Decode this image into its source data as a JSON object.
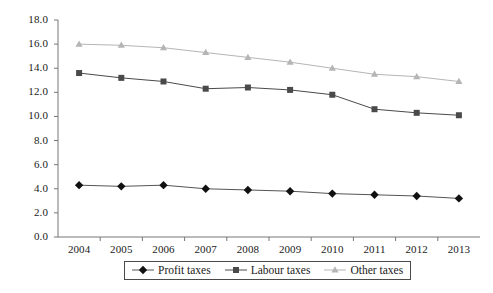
{
  "chart_data": {
    "type": "line",
    "title": "",
    "subtitle": "",
    "xlabel": "",
    "ylabel": "",
    "categories": [
      "2004",
      "2005",
      "2006",
      "2007",
      "2008",
      "2009",
      "2010",
      "2011",
      "2012",
      "2013"
    ],
    "ylim": [
      0.0,
      18.0
    ],
    "ytick_values": [
      0.0,
      2.0,
      4.0,
      6.0,
      8.0,
      10.0,
      12.0,
      14.0,
      16.0,
      18.0
    ],
    "ytick_labels": [
      "0.0",
      "2.0",
      "4.0",
      "6.0",
      "8.0",
      "10.0",
      "12.0",
      "14.0",
      "16.0",
      "18.0"
    ],
    "grid": false,
    "legend_position": "bottom-center",
    "series": [
      {
        "name": "Profit taxes",
        "marker": "diamond",
        "color": "#111111",
        "line_color": "#555555",
        "values": [
          4.3,
          4.2,
          4.3,
          4.0,
          3.9,
          3.8,
          3.6,
          3.5,
          3.4,
          3.2
        ]
      },
      {
        "name": "Labour taxes",
        "marker": "square",
        "color": "#4a4a4a",
        "line_color": "#4a4a4a",
        "values": [
          13.6,
          13.2,
          12.9,
          12.3,
          12.4,
          12.2,
          11.8,
          10.6,
          10.3,
          10.1
        ]
      },
      {
        "name": "Other taxes",
        "marker": "triangle",
        "color": "#b5b5b5",
        "line_color": "#b5b5b5",
        "values": [
          16.0,
          15.9,
          15.7,
          15.3,
          14.9,
          14.5,
          14.0,
          13.5,
          13.3,
          12.9
        ]
      }
    ]
  },
  "legend": {
    "items": [
      {
        "label": "Profit taxes"
      },
      {
        "label": "Labour taxes"
      },
      {
        "label": "Other taxes"
      }
    ]
  },
  "axes": {
    "y_axis_color": "#777777",
    "x_axis_color": "#777777"
  }
}
